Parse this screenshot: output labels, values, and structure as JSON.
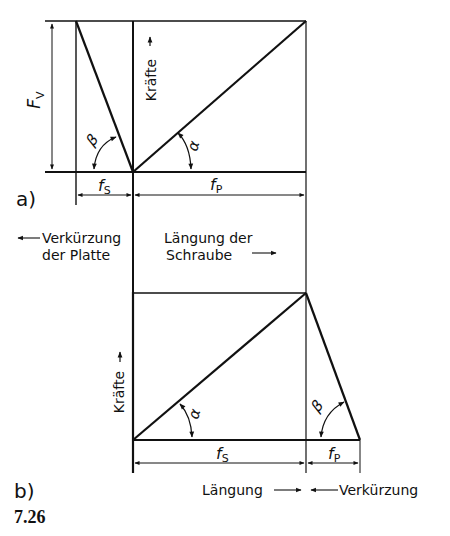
{
  "figure": {
    "number": "7.26",
    "panel_a": {
      "label": "a)",
      "force_axis_label": "Kräfte",
      "preload_label": "F",
      "preload_subscript": "V",
      "angle_left": "β",
      "angle_right": "α",
      "dim_left": {
        "symbol": "f",
        "subscript": "S"
      },
      "dim_right": {
        "symbol": "f",
        "subscript": "P"
      },
      "left_caption_line1": "Verkürzung",
      "left_caption_line2": "der Platte",
      "right_caption_line1": "Längung der",
      "right_caption_line2": "Schraube"
    },
    "panel_b": {
      "label": "b)",
      "force_axis_label": "Kräfte",
      "angle_left": "α",
      "angle_right": "β",
      "dim_left": {
        "symbol": "f",
        "subscript": "S"
      },
      "dim_right": {
        "symbol": "f",
        "subscript": "P"
      },
      "caption_left": "Längung",
      "caption_right": "Verkürzung"
    }
  },
  "colors": {
    "ink": "#111111",
    "background": "#ffffff"
  }
}
